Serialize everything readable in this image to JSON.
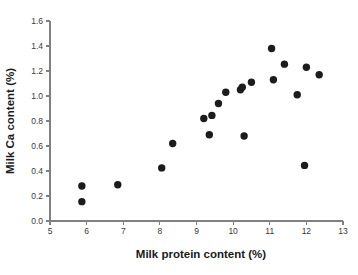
{
  "figure": {
    "background_color": "#ffffff",
    "point_color": "#1c1c1c",
    "axis_color": "#808080",
    "text_color": "#1a1a1a"
  },
  "caption": {
    "text": ""
  },
  "chart_data": {
    "type": "scatter",
    "title": "",
    "subtitle": "",
    "xlabel": "Milk protein content (%)",
    "ylabel": "Milk Ca content (%)",
    "xlim": [
      5,
      13
    ],
    "ylim": [
      0.0,
      1.6
    ],
    "xticks": [
      5,
      6,
      7,
      8,
      9,
      10,
      11,
      12,
      13
    ],
    "xticklabels": [
      "5",
      "6",
      "7",
      "8",
      "9",
      "10",
      "11",
      "12",
      "13"
    ],
    "yticks": [
      0.0,
      0.2,
      0.4,
      0.6,
      0.8,
      1.0,
      1.2,
      1.4,
      1.6
    ],
    "yticklabels": [
      "0.0",
      "0.2",
      "0.4",
      "0.6",
      "0.8",
      "1.0",
      "1.2",
      "1.4",
      "1.6"
    ],
    "grid": false,
    "legend": false,
    "legend_position": "none",
    "marker": "circle",
    "marker_size": 5,
    "series": [
      {
        "name": "Milk samples",
        "color": "#1c1c1c",
        "points": [
          {
            "x": 5.87,
            "y": 0.28
          },
          {
            "x": 5.87,
            "y": 0.155
          },
          {
            "x": 6.85,
            "y": 0.29
          },
          {
            "x": 8.05,
            "y": 0.425
          },
          {
            "x": 8.35,
            "y": 0.62
          },
          {
            "x": 9.2,
            "y": 0.82
          },
          {
            "x": 9.35,
            "y": 0.69
          },
          {
            "x": 9.42,
            "y": 0.845
          },
          {
            "x": 9.6,
            "y": 0.94
          },
          {
            "x": 9.8,
            "y": 1.03
          },
          {
            "x": 10.2,
            "y": 1.05
          },
          {
            "x": 10.25,
            "y": 1.07
          },
          {
            "x": 10.3,
            "y": 0.68
          },
          {
            "x": 10.5,
            "y": 1.11
          },
          {
            "x": 11.05,
            "y": 1.38
          },
          {
            "x": 11.1,
            "y": 1.13
          },
          {
            "x": 11.4,
            "y": 1.255
          },
          {
            "x": 11.75,
            "y": 1.01
          },
          {
            "x": 11.95,
            "y": 0.445
          },
          {
            "x": 12.0,
            "y": 1.23
          },
          {
            "x": 12.35,
            "y": 1.17
          }
        ]
      }
    ]
  }
}
